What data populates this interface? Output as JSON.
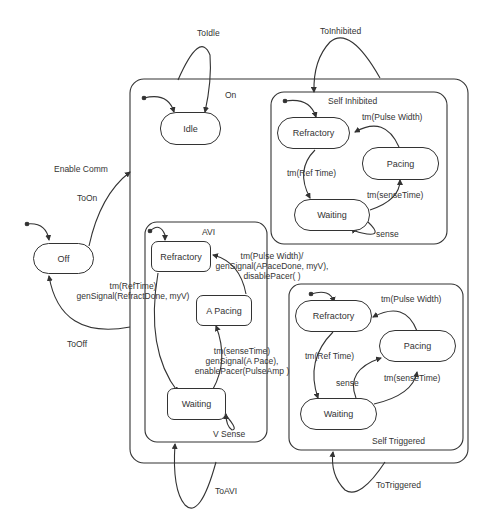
{
  "diagram": {
    "type": "hierarchical-state-machine",
    "top_states": {
      "off": "Off",
      "on": "On"
    },
    "on_substates": {
      "idle": "Idle",
      "self_inhibited": {
        "title": "Self Inhibited",
        "states": {
          "refractory": "Refractory",
          "pacing": "Pacing",
          "waiting": "Waiting"
        },
        "transitions": {
          "pulse_width": "tm(Pulse Width)",
          "ref_time": "tm(Ref Time)",
          "sense_time": "tm(senseTime)",
          "sense": "sense"
        }
      },
      "avi": {
        "title": "AVI",
        "states": {
          "refractory": "Refractory",
          "a_pacing": "A Pacing",
          "waiting": "Waiting"
        },
        "transitions": {
          "pulse_width_line1": "tm(Pulse Width)/",
          "pulse_width_line2": "genSignal(APaceDone, myV),",
          "pulse_width_line3": "disablePacer( )",
          "ref_time_line1": "tm(RefTime)",
          "ref_time_line2": "genSignal(RefractDone, myV)",
          "sense_time_line1": "tm(senseTime)",
          "sense_time_line2": "genSignal(A Pace),",
          "sense_time_line3": "enablePacer(PulseAmp )",
          "v_sense": "V Sense"
        }
      },
      "self_triggered": {
        "title": "Self Triggered",
        "states": {
          "refractory": "Refractory",
          "pacing": "Pacing",
          "waiting": "Waiting"
        },
        "transitions": {
          "pulse_width": "tm(Pulse Width)",
          "ref_time": "tm(Ref Time)",
          "sense_time": "tm(senseTime)",
          "sense": "sense"
        }
      }
    },
    "top_transitions": {
      "to_idle": "ToIdle",
      "to_inhibited": "ToInhibited",
      "enable_comm": "Enable Comm",
      "to_on": "ToOn",
      "to_off": "ToOff",
      "to_avi": "ToAVI",
      "to_triggered": "ToTriggered"
    }
  }
}
